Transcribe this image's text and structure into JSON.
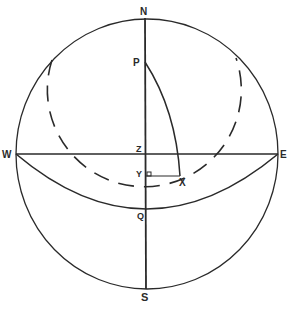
{
  "diagram": {
    "type": "celestial-sphere",
    "labels": {
      "N": "N",
      "P": "P",
      "Z": "Z",
      "Y": "Y",
      "X": "X",
      "W": "W",
      "E": "E",
      "Q": "Q",
      "S": "S"
    },
    "colors": {
      "stroke": "#2a2a2a",
      "background": "#ffffff"
    }
  }
}
